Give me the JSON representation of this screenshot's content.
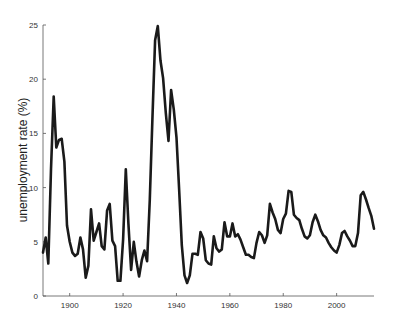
{
  "chart_data": {
    "type": "line",
    "title": "",
    "xlabel": "",
    "ylabel": "unemployment rate (%)",
    "xlim": [
      1890,
      2014
    ],
    "ylim": [
      0,
      25
    ],
    "grid": false,
    "legend": null,
    "x_ticks": [
      1900,
      1920,
      1940,
      1960,
      1980,
      2000
    ],
    "y_ticks": [
      0,
      5,
      10,
      15,
      20,
      25
    ],
    "series": [
      {
        "name": "unemployment rate",
        "color": "#1a1a1a",
        "x": [
          1890,
          1891,
          1892,
          1893,
          1894,
          1895,
          1896,
          1897,
          1898,
          1899,
          1900,
          1901,
          1902,
          1903,
          1904,
          1905,
          1906,
          1907,
          1908,
          1909,
          1910,
          1911,
          1912,
          1913,
          1914,
          1915,
          1916,
          1917,
          1918,
          1919,
          1920,
          1921,
          1922,
          1923,
          1924,
          1925,
          1926,
          1927,
          1928,
          1929,
          1930,
          1931,
          1932,
          1933,
          1934,
          1935,
          1936,
          1937,
          1938,
          1939,
          1940,
          1941,
          1942,
          1943,
          1944,
          1945,
          1946,
          1947,
          1948,
          1949,
          1950,
          1951,
          1952,
          1953,
          1954,
          1955,
          1956,
          1957,
          1958,
          1959,
          1960,
          1961,
          1962,
          1963,
          1964,
          1965,
          1966,
          1967,
          1968,
          1969,
          1970,
          1971,
          1972,
          1973,
          1974,
          1975,
          1976,
          1977,
          1978,
          1979,
          1980,
          1981,
          1982,
          1983,
          1984,
          1985,
          1986,
          1987,
          1988,
          1989,
          1990,
          1991,
          1992,
          1993,
          1994,
          1995,
          1996,
          1997,
          1998,
          1999,
          2000,
          2001,
          2002,
          2003,
          2004,
          2005,
          2006,
          2007,
          2008,
          2009,
          2010,
          2011,
          2012,
          2013,
          2014
        ],
        "values": [
          4.0,
          5.4,
          3.0,
          11.7,
          18.4,
          13.7,
          14.4,
          14.5,
          12.4,
          6.5,
          5.0,
          4.0,
          3.7,
          3.9,
          5.4,
          4.3,
          1.7,
          2.8,
          8.0,
          5.1,
          5.9,
          6.7,
          4.6,
          4.3,
          7.9,
          8.5,
          5.1,
          4.6,
          1.4,
          1.4,
          5.2,
          11.7,
          6.7,
          2.4,
          5.0,
          3.2,
          1.8,
          3.3,
          4.2,
          3.2,
          8.9,
          16.3,
          23.6,
          24.9,
          21.7,
          20.1,
          16.9,
          14.3,
          19.0,
          17.2,
          14.6,
          9.9,
          4.7,
          1.9,
          1.2,
          1.9,
          3.9,
          3.9,
          3.8,
          5.9,
          5.3,
          3.3,
          3.0,
          2.9,
          5.5,
          4.4,
          4.1,
          4.3,
          6.8,
          5.5,
          5.5,
          6.7,
          5.5,
          5.7,
          5.2,
          4.5,
          3.8,
          3.8,
          3.6,
          3.5,
          4.9,
          5.9,
          5.6,
          4.9,
          5.6,
          8.5,
          7.7,
          7.1,
          6.1,
          5.8,
          7.1,
          7.6,
          9.7,
          9.6,
          7.5,
          7.2,
          7.0,
          6.2,
          5.5,
          5.3,
          5.6,
          6.8,
          7.5,
          6.9,
          6.1,
          5.6,
          5.4,
          4.9,
          4.5,
          4.2,
          4.0,
          4.7,
          5.8,
          6.0,
          5.5,
          5.1,
          4.6,
          4.6,
          5.8,
          9.3,
          9.6,
          8.9,
          8.1,
          7.4,
          6.2
        ]
      }
    ]
  }
}
